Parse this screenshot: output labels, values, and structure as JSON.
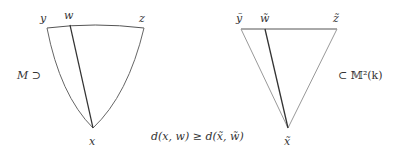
{
  "diagram": {
    "left_triangle": {
      "space_label": "M ⊃",
      "vertices": {
        "y": "y",
        "w": "w",
        "z": "z",
        "x": "x"
      }
    },
    "right_triangle": {
      "space_label": "⊂ 𝕄²(k)",
      "vertices": {
        "y": "ỹ",
        "w": "w̃",
        "z": "z̃",
        "x": "x̃"
      }
    },
    "inequality": "d(x, w) ≥ d(x̃, w̃)",
    "colors": {
      "stroke_dark": "#333333",
      "stroke_light": "#888888"
    }
  }
}
